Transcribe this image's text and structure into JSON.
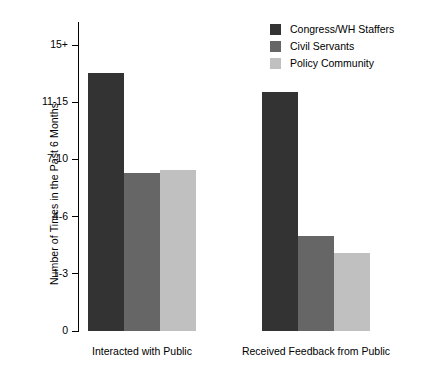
{
  "chart_data": {
    "type": "bar",
    "title": "",
    "xlabel": "",
    "ylabel": "Number of Times in the Past 6 Months",
    "categories": [
      "Interacted with Public",
      "Received Feedback from Public"
    ],
    "ytick_labels": [
      "0",
      "1-3",
      "4-6",
      "7-10",
      "11-15",
      "15+"
    ],
    "ytick_values": [
      0,
      1,
      2,
      3,
      4,
      5
    ],
    "ylim": [
      0,
      5.4
    ],
    "grid": false,
    "legend_position": "top-right",
    "series": [
      {
        "name": "Congress/WH Staffers",
        "color": "#333333",
        "values": [
          4.51,
          4.18
        ]
      },
      {
        "name": "Civil Servants",
        "color": "#666666",
        "values": [
          2.76,
          1.66
        ]
      },
      {
        "name": "Policy Community",
        "color": "#c0c0c0",
        "values": [
          2.81,
          1.36
        ]
      }
    ]
  },
  "legend": {
    "items": [
      {
        "label": "Congress/WH Staffers",
        "color": "#333333"
      },
      {
        "label": "Civil Servants",
        "color": "#666666"
      },
      {
        "label": "Policy Community",
        "color": "#c0c0c0"
      }
    ]
  },
  "axes": {
    "y_title": "Number of Times in the Past 6 Months",
    "y_ticks": [
      {
        "label": "15+",
        "value": 5
      },
      {
        "label": "11-15",
        "value": 4
      },
      {
        "label": "7-10",
        "value": 3
      },
      {
        "label": "4-6",
        "value": 2
      },
      {
        "label": "1-3",
        "value": 1
      },
      {
        "label": "0",
        "value": 0
      }
    ],
    "x_categories": [
      {
        "label": "Interacted with Public"
      },
      {
        "label": "Received Feedback from Public"
      }
    ]
  }
}
